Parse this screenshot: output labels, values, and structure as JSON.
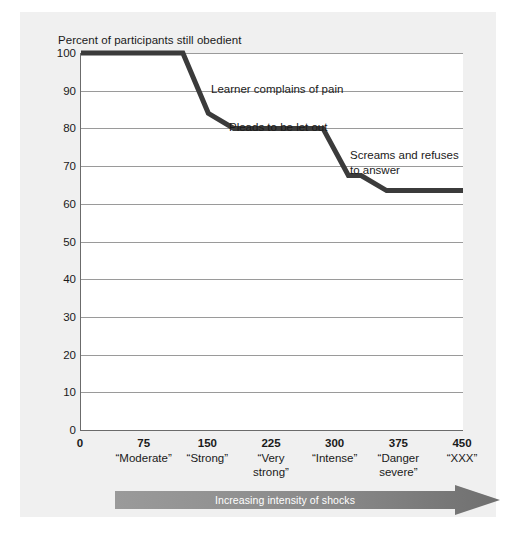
{
  "figure": {
    "y_axis_title": "Percent of participants still obedient",
    "arrow_label": "Increasing intensity of shocks"
  },
  "chart_data": {
    "type": "line",
    "title": "",
    "subtitle": "",
    "xlabel": "Increasing intensity of shocks",
    "ylabel": "Percent of participants still obedient",
    "xlim": [
      0,
      450
    ],
    "ylim": [
      0,
      100
    ],
    "grid": true,
    "legend": "none",
    "x_ticks": [
      0,
      75,
      150,
      225,
      300,
      375,
      450
    ],
    "x_tick_labels": [
      "0",
      "75",
      "150",
      "225",
      "300",
      "375",
      "450"
    ],
    "x_tick_captions": [
      "",
      "“Moderate”",
      "“Strong”",
      "“Very\nstrong”",
      "“Intense”",
      "“Danger\nsevere”",
      "“XXX”"
    ],
    "y_ticks": [
      0,
      10,
      20,
      30,
      40,
      50,
      60,
      70,
      80,
      90,
      100
    ],
    "y_tick_labels": [
      "0",
      "10",
      "20",
      "30",
      "40",
      "50",
      "60",
      "70",
      "80",
      "90",
      "100"
    ],
    "series": [
      {
        "name": "Percent still obedient",
        "color": "#3b3b3b",
        "x": [
          0,
          120,
          150,
          180,
          285,
          315,
          330,
          360,
          450
        ],
        "values": [
          100,
          100,
          84,
          80,
          80,
          67.5,
          67.5,
          63.5,
          63.5
        ]
      }
    ],
    "annotations": [
      {
        "text": "Learner complains of pain",
        "x_px": 191,
        "y_px": 70
      },
      {
        "text": "Pleads to be let out",
        "x_px": 209,
        "y_px": 108
      },
      {
        "text": "Screams and refuses\nto answer",
        "x_px": 330,
        "y_px": 136
      }
    ]
  },
  "colors": {
    "panel_background": "#f0f0f0",
    "plot_background": "#ffffff",
    "line": "#3b3b3b",
    "gridline": "#9a9a9a",
    "axis": "#6b6b6b",
    "arrow": "#8c8c8c",
    "text": "#1a1a1a"
  }
}
